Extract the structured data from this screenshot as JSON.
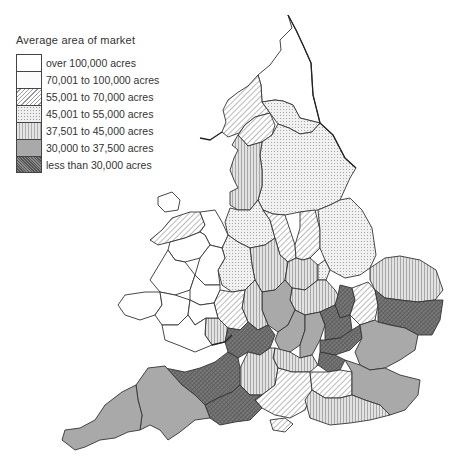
{
  "legend": {
    "title": "Average area of market",
    "items": [
      {
        "key": "c1",
        "label": "over 100,000 acres",
        "pattern": "white"
      },
      {
        "key": "c2",
        "label": "70,001 to 100,000 acres",
        "pattern": "near-white"
      },
      {
        "key": "c3",
        "label": "55,001 to 70,000 acres",
        "pattern": "diagonal-hatch"
      },
      {
        "key": "c4",
        "label": "45,001 to 55,000 acres",
        "pattern": "fine-dots"
      },
      {
        "key": "c5",
        "label": "37,501 to 45,000 acres",
        "pattern": "vertical-lines"
      },
      {
        "key": "c6",
        "label": "30,000 to 37,500 acres",
        "pattern": "mid-grey"
      },
      {
        "key": "c7",
        "label": "less than 30,000 acres",
        "pattern": "dark-crosshatch"
      }
    ]
  },
  "colors": {
    "c1": "#ffffff",
    "c2": "#fbfbfb",
    "c3": "#d9d9d9",
    "c4": "#e6e6e6",
    "c5": "#cfcfcf",
    "c6": "#a9a9a9",
    "c7": "#6e6e6e",
    "border": "#333333"
  },
  "map": {
    "subject": "England and Wales counties shaded by average area of market",
    "regions": [
      {
        "name": "northumberland",
        "cls": "c1"
      },
      {
        "name": "cumberland",
        "cls": "c3"
      },
      {
        "name": "westmorland",
        "cls": "c3"
      },
      {
        "name": "durham",
        "cls": "c4"
      },
      {
        "name": "yorkshire",
        "cls": "c4"
      },
      {
        "name": "lancashire",
        "cls": "c5"
      },
      {
        "name": "cheshire",
        "cls": "c4"
      },
      {
        "name": "derbyshire",
        "cls": "c3"
      },
      {
        "name": "nottinghamshire",
        "cls": "c3"
      },
      {
        "name": "lincolnshire",
        "cls": "c4"
      },
      {
        "name": "staffordshire",
        "cls": "c5"
      },
      {
        "name": "leicestershire",
        "cls": "c5"
      },
      {
        "name": "rutland",
        "cls": "c4"
      },
      {
        "name": "norfolk",
        "cls": "c5"
      },
      {
        "name": "suffolk",
        "cls": "c7"
      },
      {
        "name": "cambridgeshire",
        "cls": "c3"
      },
      {
        "name": "huntingdonshire",
        "cls": "c7"
      },
      {
        "name": "northamptonshire",
        "cls": "c5"
      },
      {
        "name": "warwickshire",
        "cls": "c6"
      },
      {
        "name": "shropshire",
        "cls": "c4"
      },
      {
        "name": "herefordshire",
        "cls": "c3"
      },
      {
        "name": "worcestershire",
        "cls": "c5"
      },
      {
        "name": "gloucestershire",
        "cls": "c7"
      },
      {
        "name": "oxfordshire",
        "cls": "c6"
      },
      {
        "name": "buckinghamshire",
        "cls": "c6"
      },
      {
        "name": "bedfordshire",
        "cls": "c7"
      },
      {
        "name": "hertfordshire",
        "cls": "c7"
      },
      {
        "name": "essex",
        "cls": "c6"
      },
      {
        "name": "middlesex",
        "cls": "c7"
      },
      {
        "name": "berkshire",
        "cls": "c5"
      },
      {
        "name": "wiltshire",
        "cls": "c5"
      },
      {
        "name": "hampshire",
        "cls": "c3"
      },
      {
        "name": "surrey",
        "cls": "c3"
      },
      {
        "name": "kent",
        "cls": "c6"
      },
      {
        "name": "sussex",
        "cls": "c5"
      },
      {
        "name": "isle-of-wight",
        "cls": "c3"
      },
      {
        "name": "somerset",
        "cls": "c7"
      },
      {
        "name": "dorset",
        "cls": "c7"
      },
      {
        "name": "devon",
        "cls": "c6"
      },
      {
        "name": "cornwall",
        "cls": "c6"
      },
      {
        "name": "monmouthshire",
        "cls": "c5"
      },
      {
        "name": "anglesey",
        "cls": "c1"
      },
      {
        "name": "caernarvonshire",
        "cls": "c3"
      },
      {
        "name": "wales-other",
        "cls": "c1"
      }
    ]
  }
}
